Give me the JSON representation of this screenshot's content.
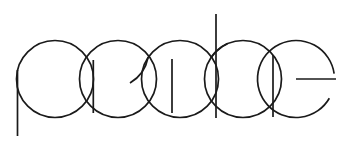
{
  "canvas": {
    "width": 353,
    "height": 145,
    "background_color": "#ffffff",
    "stroke_color": "#1a1a1a",
    "stroke_width": 1.7,
    "artwork_kind": "line-art-logotype",
    "alt_text": "Overlapping circle monoline logotype"
  },
  "geometry": {
    "baseline_y": 117.5,
    "cap_top_y": 40.5,
    "circle_radius": 38.5,
    "circle_center_y": 79,
    "circle_centers_x": [
      55,
      118,
      180,
      243,
      296
    ],
    "ascender_top_y": 14,
    "ascender_x": 216,
    "descender_bottom_y": 136,
    "descender_x": 17.5,
    "short_stem_x": 172,
    "short_stem_top_y": 59,
    "short_stem_bottom_y": 113,
    "e_bar_y": 79,
    "e_bar_x_start": 296,
    "e_bar_x_end": 336,
    "e_gap_start_deg": -8,
    "e_gap_end_deg": 30,
    "a_inner_arc_end_x": 130,
    "a_inner_arc_end_y": 83
  },
  "glyphs": [
    {
      "id": "glyph-p",
      "letter": "p",
      "parts": [
        "bowl-circle",
        "descender-stem"
      ],
      "circle_center_x": 55
    },
    {
      "id": "glyph-o",
      "letter": "o",
      "parts": [
        "bowl-circle"
      ],
      "circle_center_x": 118
    },
    {
      "id": "glyph-a",
      "letter": "a",
      "parts": [
        "bowl-circle",
        "inner-arc",
        "short-stem"
      ],
      "circle_center_x": 180
    },
    {
      "id": "glyph-c",
      "letter": "c",
      "parts": [
        "bowl-circle",
        "ascender-stem"
      ],
      "circle_center_x": 243
    },
    {
      "id": "glyph-e",
      "letter": "e",
      "parts": [
        "open-circle",
        "crossbar"
      ],
      "circle_center_x": 296
    }
  ],
  "wordmark": {
    "text": "poace",
    "visible_label": ""
  }
}
